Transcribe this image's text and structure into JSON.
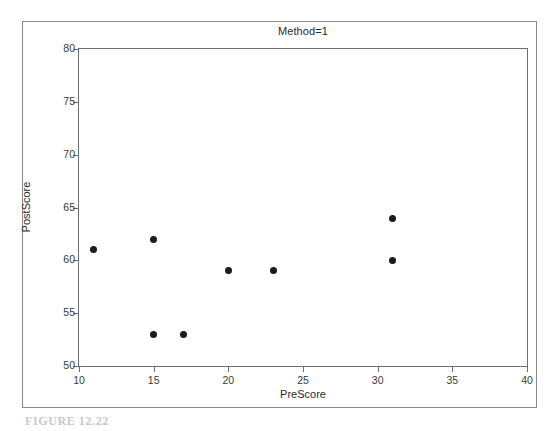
{
  "chart_data": {
    "type": "scatter",
    "title": "Method=1",
    "xlabel": "PreScore",
    "ylabel": "PostScore",
    "xlim": [
      10,
      40
    ],
    "ylim": [
      50,
      80
    ],
    "xticks": [
      10,
      15,
      20,
      25,
      30,
      35,
      40
    ],
    "yticks": [
      50,
      55,
      60,
      65,
      70,
      75,
      80
    ],
    "xtick_labels": [
      "10",
      "15",
      "20",
      "25",
      "30",
      "35",
      "40"
    ],
    "ytick_labels": [
      "50",
      "55",
      "60",
      "65",
      "70",
      "75",
      "80"
    ],
    "grid": false,
    "legend": null,
    "marker": "filled-circle",
    "marker_color": "#1b1b1b",
    "points": [
      {
        "x": 11,
        "y": 61
      },
      {
        "x": 15,
        "y": 62
      },
      {
        "x": 15,
        "y": 53
      },
      {
        "x": 17,
        "y": 53
      },
      {
        "x": 20,
        "y": 59
      },
      {
        "x": 23,
        "y": 59
      },
      {
        "x": 31,
        "y": 64
      },
      {
        "x": 31,
        "y": 60
      }
    ]
  },
  "figure": {
    "caption": "FIGURE 12.22",
    "border_color": "#8a8a8a",
    "axis_color": "#6e6e6e",
    "background": "#ffffff"
  }
}
